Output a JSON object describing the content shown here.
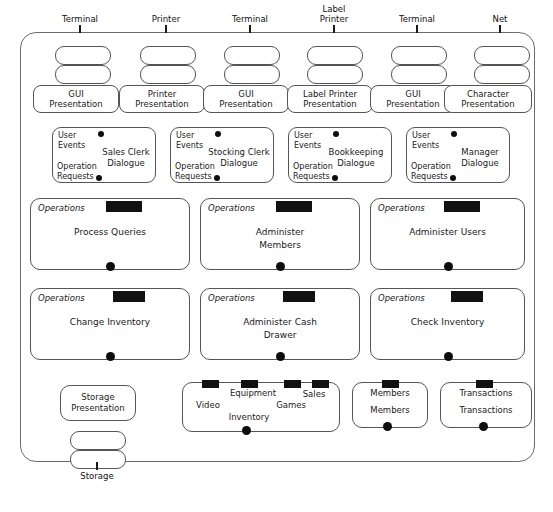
{
  "diagram": {
    "type": "uml-component-diagram",
    "colors": {
      "background": "#ffffff",
      "stroke": "#555555",
      "outer_stroke": "#6b6b6b",
      "text": "#1a1a1a",
      "connector": "#0d0d0d",
      "redaction": "#111111"
    }
  },
  "external_devices": [
    {
      "label": "Terminal",
      "x": 80
    },
    {
      "label": "Printer",
      "x": 166
    },
    {
      "label": "Terminal",
      "x": 250
    },
    {
      "label": "Label\nPrinter",
      "x": 333
    },
    {
      "label": "Terminal",
      "x": 417
    },
    {
      "label": "Net",
      "x": 500
    }
  ],
  "port_rows": {
    "upper_y": 46,
    "lower_y": 64,
    "columns": [
      55,
      140,
      224,
      307,
      391,
      474
    ]
  },
  "presentation_row": {
    "y": 83,
    "items": [
      {
        "label": "GUI\nPresentation",
        "x": 33
      },
      {
        "label": "Printer\nPresentation",
        "x": 119
      },
      {
        "label": "GUI\nPresentation",
        "x": 203
      },
      {
        "label": "Label Printer\nPresentation",
        "x": 287
      },
      {
        "label": "GUI\nPresentation",
        "x": 370
      },
      {
        "label": "Character\nPresentation",
        "x": 444
      }
    ]
  },
  "dialogue_row": {
    "y": 127,
    "events_label": "User\nEvents",
    "operations_label": "Operation\nRequests",
    "items": [
      {
        "name": "Sales Clerk\nDialogue",
        "x": 52,
        "width": 104
      },
      {
        "name": "Stocking Clerk\nDialogue",
        "x": 170,
        "width": 104
      },
      {
        "name": "Bookkeeping\nDialogue",
        "x": 288,
        "width": 104
      },
      {
        "name": "Manager\nDialogue",
        "x": 406,
        "width": 104
      }
    ]
  },
  "operations_rows": [
    {
      "y": 198,
      "caption": "Operations",
      "items": [
        {
          "name": "Process Queries",
          "x": 30,
          "width": 160
        },
        {
          "name": "Administer\nMembers",
          "x": 200,
          "width": 160
        },
        {
          "name": "Administer Users",
          "x": 370,
          "width": 155
        }
      ]
    },
    {
      "y": 288,
      "caption": "Operations",
      "items": [
        {
          "name": "Change Inventory",
          "x": 30,
          "width": 160
        },
        {
          "name": "Administer Cash\nDrawer",
          "x": 200,
          "width": 160
        },
        {
          "name": "Check Inventory",
          "x": 370,
          "width": 155
        }
      ]
    }
  ],
  "storage_row": {
    "y": 382,
    "storage_presentation": {
      "label": "Storage\nPresentation",
      "x": 60,
      "width": 76,
      "height": 36
    },
    "inventory": {
      "x": 182,
      "width": 158,
      "height": 50,
      "main_label": "Inventory",
      "sub_labels": [
        "Video",
        "Equipment",
        "Games",
        "Sales"
      ]
    },
    "members": {
      "x": 352,
      "width": 76,
      "height": 46,
      "title": "Members",
      "label": "Members"
    },
    "transactions": {
      "x": 440,
      "width": 92,
      "height": 46,
      "title": "Transactions",
      "label": "Transactions"
    }
  },
  "storage_ports": {
    "columns": [
      70
    ],
    "upper_y": 428,
    "lower_y": 446
  },
  "bottom_device": {
    "label": "Storage",
    "x": 97,
    "y": 470
  },
  "redaction_blocks": {
    "note": "solid black bars covering stereotype labels",
    "count": 12
  }
}
